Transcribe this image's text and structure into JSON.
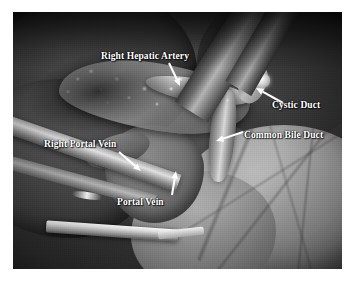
{
  "figure": {
    "kind": "intraoperative-photograph",
    "modality": "open hepatobiliary surgery — hepatic hilum dissection",
    "color_mode": "grayscale",
    "border_color": "#ffffff",
    "label_color": "#ffffff"
  },
  "annotations": [
    {
      "id": "right-hepatic-artery",
      "label": "Right Hepatic Artery",
      "label_x": 101,
      "label_y": 51,
      "arrow_from_x": 169,
      "arrow_from_y": 63,
      "arrow_to_x": 180,
      "arrow_to_y": 86
    },
    {
      "id": "cystic-duct",
      "label": "Cystic Duct",
      "label_x": 272,
      "label_y": 100,
      "arrow_from_x": 283,
      "arrow_from_y": 103,
      "arrow_to_x": 256,
      "arrow_to_y": 88
    },
    {
      "id": "common-bile-duct",
      "label": "Common Bile Duct",
      "label_x": 244,
      "label_y": 130,
      "arrow_from_x": 243,
      "arrow_from_y": 132,
      "arrow_to_x": 216,
      "arrow_to_y": 141
    },
    {
      "id": "right-portal-vein",
      "label": "Right Portal Vein",
      "label_x": 44,
      "label_y": 139,
      "arrow_from_x": 119,
      "arrow_from_y": 152,
      "arrow_to_x": 141,
      "arrow_to_y": 171
    },
    {
      "id": "portal-vein",
      "label": "Portal Vein",
      "label_x": 117,
      "label_y": 197,
      "arrow_from_x": 172,
      "arrow_from_y": 195,
      "arrow_to_x": 176,
      "arrow_to_y": 171
    }
  ]
}
